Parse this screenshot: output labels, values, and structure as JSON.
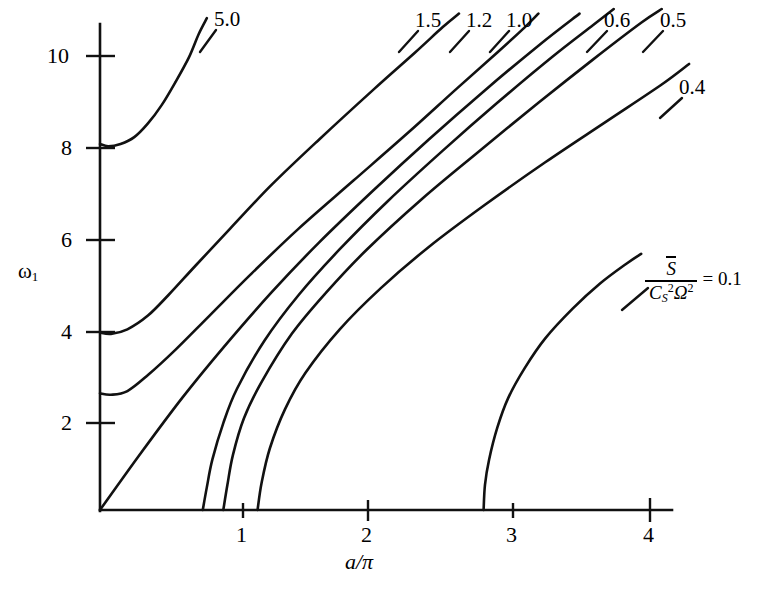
{
  "figure": {
    "background_color": "#ffffff",
    "line_color": "#111111"
  },
  "axes": {
    "y_title_main": "ω",
    "y_title_sub": "1",
    "x_title": "a/π",
    "y_ticks": [
      "2",
      "4",
      "6",
      "10"
    ],
    "y_tick_8": "8",
    "x_ticks": [
      "1",
      "2",
      "3",
      "4"
    ]
  },
  "legend": {
    "numerator": "S",
    "denominator_base": "C",
    "denominator_sub": "S",
    "denominator_sup": "2",
    "denominator_omega": "Ω",
    "denominator_omega_sup": "2",
    "equals_value": "= 0.1"
  },
  "curve_labels": {
    "l50": "5.0",
    "l15": "1.5",
    "l12": "1.2",
    "l10": "1.0",
    "l06": "0.6",
    "l05": "0.5",
    "l04": "0.4"
  },
  "chart_data": {
    "type": "line",
    "title": "",
    "xlabel": "a/π",
    "ylabel": "ω₁",
    "xlim": [
      0,
      4.45
    ],
    "ylim": [
      0,
      11.0
    ],
    "xticks": [
      1,
      2,
      3,
      4
    ],
    "yticks": [
      2,
      4,
      6,
      8,
      10
    ],
    "grid": false,
    "legend_position": "curve-labels-at-ends",
    "legend_title": "S̄ / (C_S² Ω²)",
    "series": [
      {
        "name": "5.0",
        "label": "5.0",
        "points": [
          [
            0.0,
            8.0
          ],
          [
            0.06,
            7.95
          ],
          [
            0.15,
            8.0
          ],
          [
            0.25,
            8.15
          ],
          [
            0.35,
            8.45
          ],
          [
            0.45,
            8.85
          ],
          [
            0.55,
            9.35
          ],
          [
            0.65,
            9.9
          ],
          [
            0.72,
            10.4
          ],
          [
            0.78,
            10.75
          ]
        ]
      },
      {
        "name": "1.5",
        "label": "1.5",
        "points": [
          [
            0.0,
            3.88
          ],
          [
            0.08,
            3.85
          ],
          [
            0.2,
            3.95
          ],
          [
            0.35,
            4.25
          ],
          [
            0.5,
            4.7
          ],
          [
            0.7,
            5.35
          ],
          [
            0.95,
            6.15
          ],
          [
            1.25,
            7.1
          ],
          [
            1.6,
            8.1
          ],
          [
            2.0,
            9.2
          ],
          [
            2.3,
            10.0
          ],
          [
            2.5,
            10.55
          ],
          [
            2.62,
            10.85
          ]
        ]
      },
      {
        "name": "1.2",
        "label": "1.2",
        "points": [
          [
            0.0,
            2.55
          ],
          [
            0.08,
            2.52
          ],
          [
            0.2,
            2.6
          ],
          [
            0.35,
            2.95
          ],
          [
            0.55,
            3.5
          ],
          [
            0.8,
            4.25
          ],
          [
            1.1,
            5.15
          ],
          [
            1.45,
            6.15
          ],
          [
            1.85,
            7.2
          ],
          [
            2.25,
            8.25
          ],
          [
            2.6,
            9.2
          ],
          [
            2.9,
            10.0
          ],
          [
            3.1,
            10.55
          ],
          [
            3.2,
            10.85
          ]
        ]
      },
      {
        "name": "1.0",
        "label": "1.0",
        "points": [
          [
            0.0,
            0.0
          ],
          [
            0.3,
            1.25
          ],
          [
            0.6,
            2.45
          ],
          [
            0.9,
            3.55
          ],
          [
            1.25,
            4.75
          ],
          [
            1.6,
            5.85
          ],
          [
            2.0,
            7.0
          ],
          [
            2.4,
            8.1
          ],
          [
            2.8,
            9.15
          ],
          [
            3.2,
            10.15
          ],
          [
            3.5,
            10.85
          ]
        ]
      },
      {
        "name": "0.6",
        "label": "0.6",
        "points": [
          [
            0.75,
            0.0
          ],
          [
            0.78,
            0.5
          ],
          [
            0.82,
            1.1
          ],
          [
            0.9,
            1.9
          ],
          [
            1.0,
            2.65
          ],
          [
            1.2,
            3.7
          ],
          [
            1.45,
            4.7
          ],
          [
            1.75,
            5.7
          ],
          [
            2.1,
            6.75
          ],
          [
            2.5,
            7.85
          ],
          [
            2.9,
            8.9
          ],
          [
            3.3,
            9.9
          ],
          [
            3.6,
            10.6
          ],
          [
            3.75,
            10.95
          ]
        ]
      },
      {
        "name": "0.5",
        "label": "0.5",
        "points": [
          [
            0.9,
            0.0
          ],
          [
            0.93,
            0.55
          ],
          [
            0.97,
            1.2
          ],
          [
            1.05,
            2.0
          ],
          [
            1.18,
            2.8
          ],
          [
            1.4,
            3.85
          ],
          [
            1.65,
            4.75
          ],
          [
            1.95,
            5.7
          ],
          [
            2.35,
            6.8
          ],
          [
            2.75,
            7.8
          ],
          [
            3.2,
            8.9
          ],
          [
            3.6,
            9.85
          ],
          [
            3.95,
            10.65
          ],
          [
            4.1,
            10.95
          ]
        ]
      },
      {
        "name": "0.4",
        "label": "0.4",
        "points": [
          [
            1.15,
            0.0
          ],
          [
            1.18,
            0.6
          ],
          [
            1.24,
            1.35
          ],
          [
            1.35,
            2.2
          ],
          [
            1.5,
            3.0
          ],
          [
            1.75,
            3.95
          ],
          [
            2.05,
            4.85
          ],
          [
            2.4,
            5.75
          ],
          [
            2.8,
            6.65
          ],
          [
            3.25,
            7.6
          ],
          [
            3.7,
            8.5
          ],
          [
            4.1,
            9.3
          ],
          [
            4.3,
            9.75
          ]
        ]
      },
      {
        "name": "0.1",
        "label": "0.1",
        "points": [
          [
            2.8,
            0.0
          ],
          [
            2.81,
            0.55
          ],
          [
            2.84,
            1.1
          ],
          [
            2.9,
            1.8
          ],
          [
            2.98,
            2.45
          ],
          [
            3.1,
            3.1
          ],
          [
            3.25,
            3.75
          ],
          [
            3.45,
            4.4
          ],
          [
            3.65,
            4.95
          ],
          [
            3.85,
            5.4
          ],
          [
            3.95,
            5.6
          ]
        ]
      }
    ]
  }
}
